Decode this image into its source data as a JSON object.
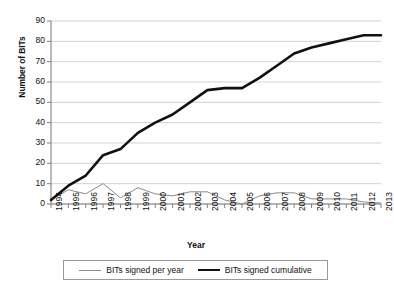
{
  "chart_data": {
    "type": "line",
    "title": "",
    "xlabel": "Year",
    "ylabel": "Number of BITs",
    "x": [
      1994,
      1995,
      1996,
      1997,
      1998,
      1999,
      2000,
      2001,
      2002,
      2003,
      2004,
      2005,
      2006,
      2007,
      2008,
      2009,
      2010,
      2011,
      2012,
      2013
    ],
    "categories": [
      "1994",
      "1995",
      "1996",
      "1997",
      "1998",
      "1999",
      "2000",
      "2001",
      "2002",
      "2003",
      "2004",
      "2005",
      "2006",
      "2007",
      "2008",
      "2009",
      "2010",
      "2011",
      "2012",
      "2013"
    ],
    "series": [
      {
        "name": "BITs signed per year",
        "color": "#8a8a8a",
        "line_width": 1,
        "values": [
          2,
          7,
          5,
          10,
          3,
          8,
          5,
          4,
          6,
          6,
          2,
          0,
          4,
          5.5,
          5.5,
          2.5,
          2.5,
          2.5,
          1,
          0.5
        ]
      },
      {
        "name": "BITs signed cumulative",
        "color": "#111111",
        "line_width": 2.6,
        "values": [
          2,
          9,
          14,
          24,
          27,
          35,
          40,
          44,
          50,
          56,
          57,
          57,
          62,
          68,
          74,
          77,
          79,
          81,
          83,
          83
        ]
      }
    ],
    "ylim": [
      0,
      90
    ],
    "yticks": [
      0,
      10,
      20,
      30,
      40,
      50,
      60,
      70,
      80,
      90
    ],
    "ytick_labels": [
      "0",
      "10",
      "20",
      "30",
      "40",
      "50",
      "60",
      "70",
      "80",
      "90"
    ],
    "grid": true,
    "grid_color": "#bfbfbf",
    "axis_color": "#808080",
    "legend_position": "bottom",
    "background": "#ffffff"
  }
}
